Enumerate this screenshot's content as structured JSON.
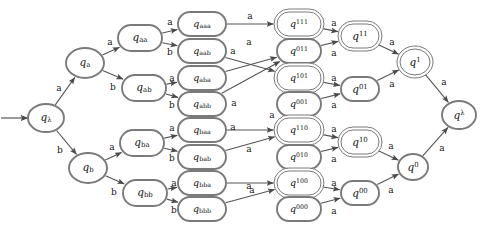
{
  "diagram": {
    "type": "finite-state-automaton",
    "title": "",
    "alphabet": [
      "a",
      "b"
    ],
    "start_state": "q_lambda",
    "colors": {
      "node_stroke": "#7a7a7a",
      "node_fill": "#ffffff",
      "edge_stroke": "#555555",
      "text": "#111111",
      "background": "#ffffff"
    },
    "nodes": [
      {
        "id": "q_lambda",
        "base": "q",
        "sub": "λ",
        "sup": "",
        "x": 46,
        "y": 118,
        "rx": 18,
        "ry": 14,
        "accepting": false,
        "shape": "ellipse"
      },
      {
        "id": "q_a",
        "base": "q",
        "sub": "a",
        "sup": "",
        "x": 85,
        "y": 63,
        "rx": 19,
        "ry": 15,
        "accepting": false,
        "shape": "ellipse"
      },
      {
        "id": "q_b",
        "base": "q",
        "sub": "b",
        "sup": "",
        "x": 88,
        "y": 168,
        "rx": 19,
        "ry": 15,
        "accepting": false,
        "shape": "ellipse"
      },
      {
        "id": "q_aa",
        "base": "q",
        "sub": "aa",
        "sup": "",
        "x": 140,
        "y": 38,
        "rx": 22,
        "ry": 13,
        "accepting": false,
        "shape": "rounded"
      },
      {
        "id": "q_ab",
        "base": "q",
        "sub": "ab",
        "sup": "",
        "x": 144,
        "y": 88,
        "rx": 22,
        "ry": 13,
        "accepting": false,
        "shape": "rounded"
      },
      {
        "id": "q_ba",
        "base": "q",
        "sub": "ba",
        "sup": "",
        "x": 142,
        "y": 143,
        "rx": 22,
        "ry": 13,
        "accepting": false,
        "shape": "rounded"
      },
      {
        "id": "q_bb",
        "base": "q",
        "sub": "bb",
        "sup": "",
        "x": 145,
        "y": 193,
        "rx": 22,
        "ry": 13,
        "accepting": false,
        "shape": "rounded"
      },
      {
        "id": "q_aaa",
        "base": "q",
        "sub": "aaa",
        "sup": "",
        "x": 202,
        "y": 24,
        "rx": 24,
        "ry": 12,
        "accepting": false,
        "shape": "rounded"
      },
      {
        "id": "q_aab",
        "base": "q",
        "sub": "aab",
        "sup": "",
        "x": 202,
        "y": 51,
        "rx": 24,
        "ry": 12,
        "accepting": false,
        "shape": "rounded"
      },
      {
        "id": "q_aba",
        "base": "q",
        "sub": "aba",
        "sup": "",
        "x": 202,
        "y": 78,
        "rx": 24,
        "ry": 12,
        "accepting": false,
        "shape": "rounded"
      },
      {
        "id": "q_abb",
        "base": "q",
        "sub": "abb",
        "sup": "",
        "x": 202,
        "y": 104,
        "rx": 24,
        "ry": 12,
        "accepting": false,
        "shape": "rounded"
      },
      {
        "id": "q_baa",
        "base": "q",
        "sub": "baa",
        "sup": "",
        "x": 202,
        "y": 130,
        "rx": 24,
        "ry": 12,
        "accepting": false,
        "shape": "rounded"
      },
      {
        "id": "q_bab",
        "base": "q",
        "sub": "bab",
        "sup": "",
        "x": 202,
        "y": 157,
        "rx": 24,
        "ry": 12,
        "accepting": false,
        "shape": "rounded"
      },
      {
        "id": "q_bba",
        "base": "q",
        "sub": "bba",
        "sup": "",
        "x": 202,
        "y": 183,
        "rx": 24,
        "ry": 12,
        "accepting": false,
        "shape": "rounded"
      },
      {
        "id": "q_bbb",
        "base": "q",
        "sub": "bbb",
        "sup": "",
        "x": 202,
        "y": 209,
        "rx": 24,
        "ry": 12,
        "accepting": false,
        "shape": "rounded"
      },
      {
        "id": "q_sup111",
        "base": "q",
        "sub": "",
        "sup": "111",
        "x": 299,
        "y": 24,
        "rx": 22,
        "ry": 12,
        "accepting": true,
        "shape": "rounded"
      },
      {
        "id": "q_sup011",
        "base": "q",
        "sub": "",
        "sup": "011",
        "x": 299,
        "y": 51,
        "rx": 22,
        "ry": 12,
        "accepting": false,
        "shape": "rounded"
      },
      {
        "id": "q_sup101",
        "base": "q",
        "sub": "",
        "sup": "101",
        "x": 299,
        "y": 78,
        "rx": 22,
        "ry": 12,
        "accepting": true,
        "shape": "rounded"
      },
      {
        "id": "q_sup001",
        "base": "q",
        "sub": "",
        "sup": "001",
        "x": 299,
        "y": 104,
        "rx": 22,
        "ry": 12,
        "accepting": false,
        "shape": "rounded"
      },
      {
        "id": "q_sup110",
        "base": "q",
        "sub": "",
        "sup": "110",
        "x": 299,
        "y": 130,
        "rx": 22,
        "ry": 12,
        "accepting": true,
        "shape": "rounded"
      },
      {
        "id": "q_sup010",
        "base": "q",
        "sub": "",
        "sup": "010",
        "x": 299,
        "y": 157,
        "rx": 22,
        "ry": 12,
        "accepting": false,
        "shape": "rounded"
      },
      {
        "id": "q_sup100",
        "base": "q",
        "sub": "",
        "sup": "100",
        "x": 299,
        "y": 183,
        "rx": 22,
        "ry": 12,
        "accepting": true,
        "shape": "rounded"
      },
      {
        "id": "q_sup000",
        "base": "q",
        "sub": "",
        "sup": "000",
        "x": 299,
        "y": 209,
        "rx": 22,
        "ry": 12,
        "accepting": false,
        "shape": "rounded"
      },
      {
        "id": "q_sup11",
        "base": "q",
        "sub": "",
        "sup": "11",
        "x": 360,
        "y": 36,
        "rx": 19,
        "ry": 12,
        "accepting": true,
        "shape": "rounded"
      },
      {
        "id": "q_sup01",
        "base": "q",
        "sub": "",
        "sup": "01",
        "x": 360,
        "y": 89,
        "rx": 19,
        "ry": 12,
        "accepting": false,
        "shape": "rounded"
      },
      {
        "id": "q_sup10",
        "base": "q",
        "sub": "",
        "sup": "10",
        "x": 360,
        "y": 142,
        "rx": 19,
        "ry": 12,
        "accepting": true,
        "shape": "rounded"
      },
      {
        "id": "q_sup00",
        "base": "q",
        "sub": "",
        "sup": "00",
        "x": 360,
        "y": 193,
        "rx": 19,
        "ry": 12,
        "accepting": false,
        "shape": "rounded"
      },
      {
        "id": "q_sup1",
        "base": "q",
        "sub": "",
        "sup": "1",
        "x": 415,
        "y": 62,
        "rx": 15,
        "ry": 13,
        "accepting": true,
        "shape": "ellipse"
      },
      {
        "id": "q_sup0",
        "base": "q",
        "sub": "",
        "sup": "0",
        "x": 413,
        "y": 167,
        "rx": 15,
        "ry": 13,
        "accepting": false,
        "shape": "ellipse"
      },
      {
        "id": "q_suplam",
        "base": "q",
        "sub": "",
        "sup": "λ",
        "x": 459,
        "y": 115,
        "rx": 17,
        "ry": 14,
        "accepting": false,
        "shape": "ellipse"
      }
    ],
    "edges": [
      {
        "from": "start-arrow",
        "to": "q_lambda",
        "label": "",
        "label_x": 0,
        "label_y": 0
      },
      {
        "from": "q_lambda",
        "to": "q_a",
        "label": "a",
        "label_x": 59,
        "label_y": 88
      },
      {
        "from": "q_lambda",
        "to": "q_b",
        "label": "b",
        "label_x": 60,
        "label_y": 150
      },
      {
        "from": "q_a",
        "to": "q_aa",
        "label": "a",
        "label_x": 110,
        "label_y": 42
      },
      {
        "from": "q_a",
        "to": "q_ab",
        "label": "b",
        "label_x": 113,
        "label_y": 87
      },
      {
        "from": "q_b",
        "to": "q_ba",
        "label": "a",
        "label_x": 112,
        "label_y": 147
      },
      {
        "from": "q_b",
        "to": "q_bb",
        "label": "b",
        "label_x": 114,
        "label_y": 192
      },
      {
        "from": "q_aa",
        "to": "q_aaa",
        "label": "a",
        "label_x": 170,
        "label_y": 22
      },
      {
        "from": "q_aa",
        "to": "q_aab",
        "label": "b",
        "label_x": 170,
        "label_y": 52
      },
      {
        "from": "q_ab",
        "to": "q_aba",
        "label": "a",
        "label_x": 172,
        "label_y": 78
      },
      {
        "from": "q_ab",
        "to": "q_abb",
        "label": "b",
        "label_x": 172,
        "label_y": 105
      },
      {
        "from": "q_ba",
        "to": "q_baa",
        "label": "a",
        "label_x": 172,
        "label_y": 128
      },
      {
        "from": "q_ba",
        "to": "q_bab",
        "label": "b",
        "label_x": 172,
        "label_y": 158
      },
      {
        "from": "q_bb",
        "to": "q_bba",
        "label": "a",
        "label_x": 174,
        "label_y": 183
      },
      {
        "from": "q_bb",
        "to": "q_bbb",
        "label": "b",
        "label_x": 174,
        "label_y": 210
      },
      {
        "from": "q_aaa",
        "to": "q_sup111",
        "label": "a",
        "label_x": 250,
        "label_y": 16
      },
      {
        "from": "q_aab",
        "to": "q_sup101",
        "label": "a",
        "label_x": 233,
        "label_y": 51
      },
      {
        "from": "q_aba",
        "to": "q_sup011",
        "label": "a",
        "label_x": 249,
        "label_y": 42
      },
      {
        "from": "q_abb",
        "to": "q_sup011",
        "label": "a",
        "label_x": 234,
        "label_y": 103
      },
      {
        "from": "q_baa",
        "to": "q_sup110",
        "label": "a",
        "label_x": 233,
        "label_y": 127
      },
      {
        "from": "q_bab",
        "to": "q_sup110",
        "label": "a",
        "label_x": 249,
        "label_y": 149
      },
      {
        "from": "q_bba",
        "to": "q_sup100",
        "label": "a",
        "label_x": 249,
        "label_y": 186
      },
      {
        "from": "q_bbb",
        "to": "q_sup100",
        "label": "a",
        "label_x": 252,
        "label_y": 190
      },
      {
        "from": "q_sup001",
        "to": "q_sup110",
        "label": "a",
        "label_x": 272,
        "label_y": 115
      },
      {
        "from": "q_sup111",
        "to": "q_sup11",
        "label": "a",
        "label_x": 334,
        "label_y": 23
      },
      {
        "from": "q_sup011",
        "to": "q_sup11",
        "label": "a",
        "label_x": 334,
        "label_y": 53
      },
      {
        "from": "q_sup101",
        "to": "q_sup01",
        "label": "a",
        "label_x": 334,
        "label_y": 78
      },
      {
        "from": "q_sup001",
        "to": "q_sup01",
        "label": "a",
        "label_x": 334,
        "label_y": 105
      },
      {
        "from": "q_sup110",
        "to": "q_sup10",
        "label": "a",
        "label_x": 334,
        "label_y": 129
      },
      {
        "from": "q_sup010",
        "to": "q_sup10",
        "label": "a",
        "label_x": 334,
        "label_y": 159
      },
      {
        "from": "q_sup100",
        "to": "q_sup00",
        "label": "a",
        "label_x": 334,
        "label_y": 183
      },
      {
        "from": "q_sup000",
        "to": "q_sup00",
        "label": "a",
        "label_x": 334,
        "label_y": 211
      },
      {
        "from": "q_sup11",
        "to": "q_sup1",
        "label": "a",
        "label_x": 392,
        "label_y": 42
      },
      {
        "from": "q_sup01",
        "to": "q_sup1",
        "label": "a",
        "label_x": 392,
        "label_y": 84
      },
      {
        "from": "q_sup10",
        "to": "q_sup0",
        "label": "a",
        "label_x": 391,
        "label_y": 146
      },
      {
        "from": "q_sup00",
        "to": "q_sup0",
        "label": "a",
        "label_x": 391,
        "label_y": 190
      },
      {
        "from": "q_sup1",
        "to": "q_suplam",
        "label": "a",
        "label_x": 444,
        "label_y": 82
      },
      {
        "from": "q_sup0",
        "to": "q_suplam",
        "label": "a",
        "label_x": 442,
        "label_y": 148
      }
    ]
  }
}
